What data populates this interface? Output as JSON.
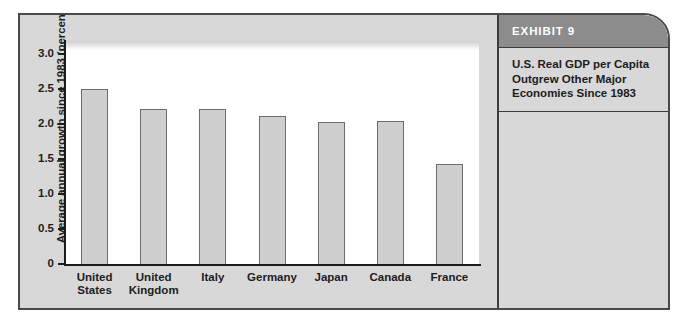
{
  "exhibit": {
    "header_label": "EXHIBIT 9",
    "title": "U.S. Real GDP per Capita\nOutgrew Other Major\nEconomies Since 1983"
  },
  "colors": {
    "frame_background": "#d8d8d8",
    "frame_border": "#4a4a4a",
    "header_background": "#8c8c8c",
    "header_text": "#ffffff",
    "plot_background": "#ffffff",
    "bar_fill": "#cfcfcf",
    "bar_border": "#6d6d6d",
    "axis": "#1c1c1c",
    "text": "#1d1d1d"
  },
  "chart_data": {
    "type": "bar",
    "title": "U.S. Real GDP per Capita Outgrew Other Major Economies Since 1983",
    "xlabel": "",
    "ylabel": "Average annual growth since 1983 (percent)",
    "ylim": [
      0,
      3.0
    ],
    "ytick_labels": [
      "3.0",
      "2.5",
      "2.0",
      "1.5",
      "1.0",
      "0.5",
      "0"
    ],
    "ytick_values": [
      3.0,
      2.5,
      2.0,
      1.5,
      1.0,
      0.5,
      0
    ],
    "grid": false,
    "legend": false,
    "categories": [
      "United\nStates",
      "United\nKingdom",
      "Italy",
      "Germany",
      "Japan",
      "Canada",
      "France"
    ],
    "values": [
      2.5,
      2.21,
      2.22,
      2.12,
      2.03,
      2.04,
      1.43
    ]
  }
}
